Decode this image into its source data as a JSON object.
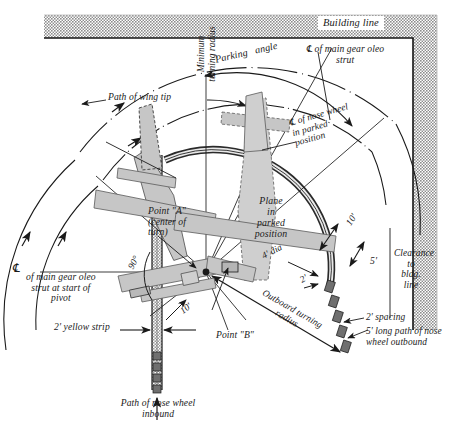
{
  "figure": {
    "type": "engineering-plan-diagram"
  },
  "building": {
    "label": "Building line",
    "hatch_color": "#9e9e9e",
    "outline_color": "#1a1a1a"
  },
  "labels": {
    "building_line": "Building line",
    "main_gear_oleo_strut_top": "℄ of main gear oleo\nstrut",
    "parking_angle": "Parking   angle",
    "path_of_wing_tip": "Path of wing tip",
    "minimum_turning_radius": "Minimum\nturning radius",
    "nose_wheel_parked": "℄ of nose wheel\nin parked\nposition",
    "plane_in_parked_position": "Plane\nin\nparked\nposition",
    "point_a": "Point \"A\"\n(center of\nturn)",
    "point_b": "Point \"B\"",
    "outboard_turning_radius": "Outboard turning\nradius",
    "main_gear_oleo_strut_pivot": "of main gear oleo\nstrut at start of\npivot",
    "cl_symbol_left": "℄",
    "yellow_strip": "2' yellow strip",
    "angle_90": "90°",
    "dim_10_left": "10'",
    "dim_10_right": "10'",
    "dim_5": "5'",
    "dim_2_mid": "2'",
    "dim_2_left": "2'",
    "dia_4": "4' dia",
    "clearance_to_bldg_line": "Clearance\nto\nbldg.\nline",
    "spacing_2": "2' spacing",
    "long_path_nose_wheel": "5' long path of nose\nwheel outbound",
    "path_of_nose_wheel_inbound": "Path of nose wheel\ninbound"
  },
  "dimensions": {
    "values": [
      "10'",
      "5'",
      "2'",
      "4' dia",
      "2'",
      "10'",
      "90°"
    ],
    "notes": [
      "2' spacing",
      "5' long path of nose wheel outbound",
      "2' yellow strip"
    ]
  },
  "geometry": {
    "center_of_turn": {
      "x": 206,
      "y": 272
    },
    "radii": {
      "wing_tip_path": 200,
      "minimum_turning_radius": 118,
      "outboard_turning_radius": 148
    }
  },
  "colors": {
    "aircraft_fill": "#c9c9c9",
    "line": "#1a1a1a",
    "hatch": "#9d9d9d",
    "stripe": "#b0b0b0"
  }
}
